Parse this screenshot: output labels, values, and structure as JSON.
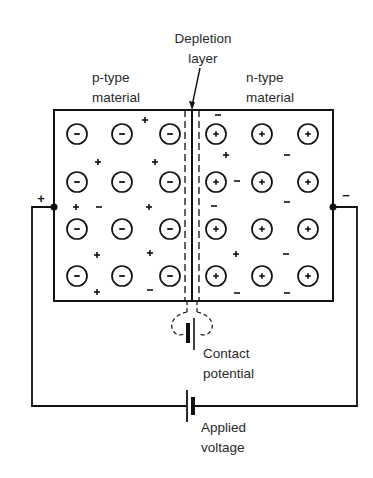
{
  "labels": {
    "depletion": [
      "Depletion",
      "layer"
    ],
    "p_type": [
      "p-type",
      "material"
    ],
    "n_type": [
      "n-type",
      "material"
    ],
    "contact": [
      "Contact",
      "potential"
    ],
    "applied": [
      "Applied",
      "voltage"
    ],
    "terminal_left": "+",
    "terminal_right": "−"
  },
  "p_region": {
    "ion_sign": "−",
    "ion_columns_x": [
      77,
      122,
      170
    ],
    "ion_rows_y": [
      134,
      182,
      229,
      276
    ],
    "free_carriers": [
      {
        "x": 145,
        "y": 120,
        "s": "+"
      },
      {
        "x": 98,
        "y": 162,
        "s": "+"
      },
      {
        "x": 155,
        "y": 162,
        "s": "+"
      },
      {
        "x": 76,
        "y": 207,
        "s": "+"
      },
      {
        "x": 99,
        "y": 207,
        "s": "−"
      },
      {
        "x": 149,
        "y": 207,
        "s": "+"
      },
      {
        "x": 97,
        "y": 255,
        "s": "+"
      },
      {
        "x": 150,
        "y": 253,
        "s": "+"
      },
      {
        "x": 97,
        "y": 292,
        "s": "+"
      },
      {
        "x": 150,
        "y": 290,
        "s": "−"
      }
    ]
  },
  "n_region": {
    "ion_sign": "+",
    "ion_columns_x": [
      216,
      262,
      308
    ],
    "ion_rows_y": [
      134,
      182,
      229,
      276
    ],
    "free_carriers": [
      {
        "x": 218,
        "y": 115,
        "s": "−"
      },
      {
        "x": 226,
        "y": 155,
        "s": "+"
      },
      {
        "x": 287,
        "y": 155,
        "s": "−"
      },
      {
        "x": 237,
        "y": 181,
        "s": "−"
      },
      {
        "x": 214,
        "y": 206,
        "s": "−"
      },
      {
        "x": 287,
        "y": 202,
        "s": "−"
      },
      {
        "x": 236,
        "y": 254,
        "s": "+"
      },
      {
        "x": 286,
        "y": 254,
        "s": "−"
      },
      {
        "x": 237,
        "y": 293,
        "s": "−"
      },
      {
        "x": 287,
        "y": 293,
        "s": "−"
      }
    ]
  },
  "colors": {
    "ink": "#111111",
    "text": "#2a2a2a",
    "background": "#ffffff"
  }
}
